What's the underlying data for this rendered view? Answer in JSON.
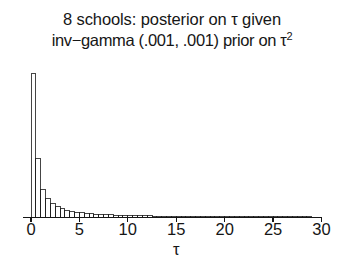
{
  "figure": {
    "title_line_1": "8 schools:  posterior on τ given",
    "title_line_2_a": "inv−gamma (.001, .001) prior on τ",
    "title_line_2_sup": "2",
    "axis_title": "τ",
    "ink_color": "#161616",
    "background_color": "#ffffff"
  },
  "chart_data": {
    "type": "bar",
    "xlabel": "τ",
    "ylabel": "",
    "xlim": [
      0,
      30
    ],
    "ylim": [
      0,
      1
    ],
    "grid": false,
    "legend": "none",
    "bin_width": 0.5,
    "tick_values": [
      0,
      5,
      10,
      15,
      20,
      25,
      30
    ],
    "tick_labels": [
      "0",
      "5",
      "10",
      "15",
      "20",
      "25",
      "30"
    ],
    "categories": [
      "0.00",
      "0.50",
      "1.00",
      "1.50",
      "2.00",
      "2.50",
      "3.00",
      "3.50",
      "4.00",
      "4.50",
      "5.00",
      "5.50",
      "6.00",
      "6.50",
      "7.00",
      "7.50",
      "8.00",
      "8.50",
      "9.00",
      "9.50",
      "10.00",
      "10.50",
      "11.00",
      "11.50",
      "12.00",
      "12.50",
      "13.00",
      "13.50",
      "14.00",
      "14.50",
      "15.00",
      "15.50",
      "16.00",
      "16.50",
      "17.00",
      "17.50",
      "18.00",
      "18.50",
      "19.00",
      "19.50",
      "20.00",
      "20.50",
      "21.00",
      "21.50",
      "22.00",
      "22.50",
      "23.00",
      "23.50",
      "24.00",
      "24.50",
      "25.00",
      "25.50",
      "26.00",
      "26.50",
      "27.00",
      "27.50",
      "28.00",
      "28.50",
      "29.00",
      "29.50"
    ],
    "values": [
      1.0,
      0.405,
      0.196,
      0.131,
      0.097,
      0.075,
      0.06,
      0.05,
      0.043,
      0.037,
      0.033,
      0.029,
      0.026,
      0.024,
      0.022,
      0.02,
      0.018,
      0.017,
      0.016,
      0.015,
      0.014,
      0.013,
      0.012,
      0.012,
      0.011,
      0.01,
      0.01,
      0.009,
      0.009,
      0.009,
      0.008,
      0.008,
      0.008,
      0.007,
      0.007,
      0.007,
      0.007,
      0.006,
      0.006,
      0.006,
      0.006,
      0.006,
      0.005,
      0.005,
      0.005,
      0.005,
      0.005,
      0.005,
      0.005,
      0.004,
      0.004,
      0.004,
      0.004,
      0.004,
      0.004,
      0.004,
      0.004,
      0.004,
      0.003,
      0.003
    ]
  }
}
